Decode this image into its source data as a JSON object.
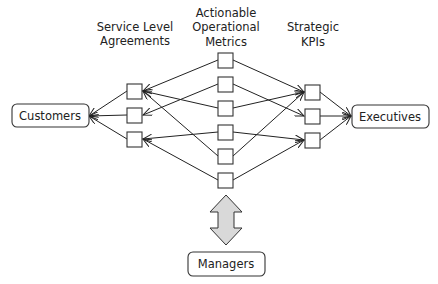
{
  "diagram": {
    "type": "flow-network",
    "column_headers": {
      "sla": [
        "Service Level",
        "Agreements"
      ],
      "metrics": [
        "Actionable",
        "Operational",
        "Metrics"
      ],
      "kpis": [
        "Strategic",
        "KPIs"
      ]
    },
    "endpoints": {
      "customers": "Customers",
      "executives": "Executives",
      "managers": "Managers"
    },
    "sla_nodes": [
      {
        "id": "sla1",
        "x": 127,
        "y": 84
      },
      {
        "id": "sla2",
        "x": 127,
        "y": 108
      },
      {
        "id": "sla3",
        "x": 127,
        "y": 132
      }
    ],
    "metric_nodes": [
      {
        "id": "m1",
        "x": 218,
        "y": 53
      },
      {
        "id": "m2",
        "x": 218,
        "y": 77
      },
      {
        "id": "m3",
        "x": 218,
        "y": 101
      },
      {
        "id": "m4",
        "x": 218,
        "y": 125
      },
      {
        "id": "m5",
        "x": 218,
        "y": 149
      },
      {
        "id": "m6",
        "x": 218,
        "y": 173
      }
    ],
    "kpi_nodes": [
      {
        "id": "kpi1",
        "x": 305,
        "y": 85
      },
      {
        "id": "kpi2",
        "x": 305,
        "y": 109
      },
      {
        "id": "kpi3",
        "x": 305,
        "y": 133
      }
    ],
    "edges": [
      {
        "from": "m1",
        "to": "sla1"
      },
      {
        "from": "m2",
        "to": "sla2"
      },
      {
        "from": "m3",
        "to": "sla1"
      },
      {
        "from": "m4",
        "to": "sla3"
      },
      {
        "from": "m5",
        "to": "sla1"
      },
      {
        "from": "m6",
        "to": "sla3"
      },
      {
        "from": "m1",
        "to": "kpi1"
      },
      {
        "from": "m2",
        "to": "kpi2"
      },
      {
        "from": "m3",
        "to": "kpi1"
      },
      {
        "from": "m4",
        "to": "kpi3"
      },
      {
        "from": "m5",
        "to": "kpi1"
      },
      {
        "from": "m6",
        "to": "kpi3"
      },
      {
        "from": "sla1",
        "to": "customers"
      },
      {
        "from": "sla2",
        "to": "customers"
      },
      {
        "from": "sla3",
        "to": "customers"
      },
      {
        "from": "kpi1",
        "to": "executives"
      },
      {
        "from": "kpi2",
        "to": "executives"
      },
      {
        "from": "kpi3",
        "to": "executives"
      },
      {
        "from": "managers",
        "to": "metrics",
        "style": "double-arrow"
      }
    ],
    "colors": {
      "stroke": "#222222",
      "double_arrow_fill": "#d9d9d9"
    }
  }
}
